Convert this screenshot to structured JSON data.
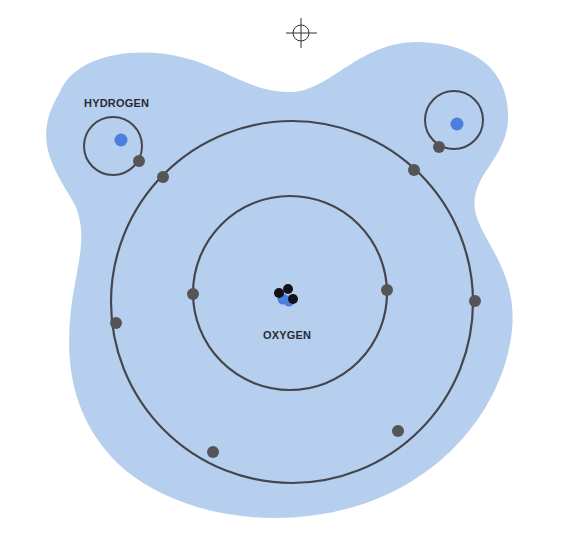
{
  "diagram": {
    "type": "water molecule atomic model",
    "labels": {
      "hydrogen": "HYDROGEN",
      "oxygen": "OXYGEN"
    },
    "colors": {
      "background": "#ffffff",
      "cloud": "#b7cfee",
      "orbit": "#45464d",
      "electron": "#555558",
      "proton": "#4a7fe0",
      "nucleus_dark": "#111118",
      "nucleus_blue": "#4a7fe0",
      "registration_mark": "#333333"
    },
    "atoms": [
      {
        "name": "hydrogen-left",
        "orbits": 1,
        "electrons": 1
      },
      {
        "name": "hydrogen-right",
        "orbits": 1,
        "electrons": 1
      },
      {
        "name": "oxygen",
        "orbits": 2,
        "inner_shell_electrons": 2,
        "outer_shell_electrons": 6
      }
    ],
    "registration_mark": "crosshair"
  }
}
